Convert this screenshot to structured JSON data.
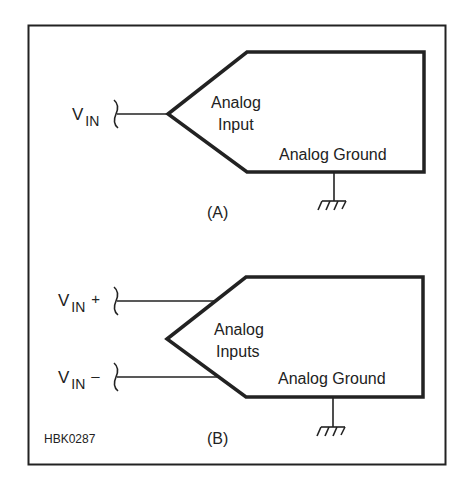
{
  "figure_id": "HBK0287",
  "colors": {
    "stroke": "#222222",
    "background": "#ffffff"
  },
  "panel_a": {
    "caption": "(A)",
    "input_label_main": "V",
    "input_label_sub": "IN",
    "block_label_line1": "Analog",
    "block_label_line2": "Input",
    "ground_label": "Analog Ground"
  },
  "panel_b": {
    "caption": "(B)",
    "input_pos_main": "V",
    "input_pos_sub": "IN",
    "input_pos_sign": "+",
    "input_neg_main": "V",
    "input_neg_sub": "IN",
    "input_neg_sign": "–",
    "block_label_line1": "Analog",
    "block_label_line2": "Inputs",
    "ground_label": "Analog Ground"
  }
}
